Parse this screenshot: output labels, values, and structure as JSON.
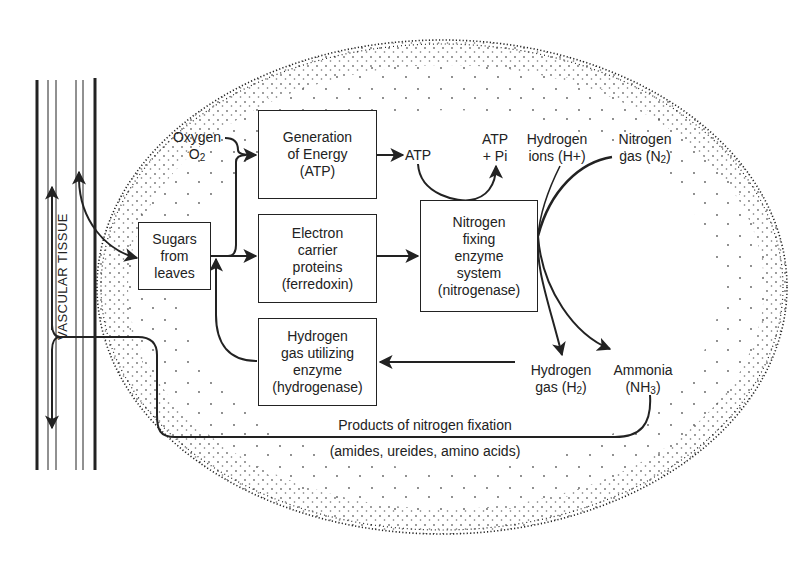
{
  "diagram": {
    "vascular_label": "VASCULAR TISSUE",
    "nodes": {
      "sugars": {
        "lines": [
          "Sugars",
          "from",
          "leaves"
        ]
      },
      "energy": {
        "lines": [
          "Generation",
          "of Energy",
          "(ATP)"
        ]
      },
      "electron": {
        "lines": [
          "Electron",
          "carrier",
          "proteins",
          "(ferredoxin)"
        ]
      },
      "hydrogenase": {
        "lines": [
          "Hydrogen",
          "gas utilizing",
          "enzyme",
          "(hydrogenase)"
        ]
      },
      "nitrogenase": {
        "lines": [
          "Nitrogen",
          "fixing",
          "enzyme",
          "system",
          "(nitrogenase)"
        ]
      }
    },
    "labels": {
      "oxygen": "Oxygen",
      "o2_base": "O",
      "o2_sub": "2",
      "atp": "ATP",
      "atp_pi_1": "ATP",
      "atp_pi_2": "+ Pi",
      "h_ions_1": "Hydrogen",
      "h_ions_2": "ions (H+)",
      "n2_1": "Nitrogen",
      "n2_2_base": "gas (N",
      "n2_2_sub": "2",
      "n2_2_end": ")",
      "h2_1": "Hydrogen",
      "h2_2_base": "gas (H",
      "h2_2_sub": "2",
      "h2_2_end": ")",
      "nh3_1": "Ammonia",
      "nh3_2_base": "(NH",
      "nh3_2_sub": "3",
      "nh3_2_end": ")",
      "products_1": "Products of nitrogen fixation",
      "products_2": "(amides, ureides, amino acids)"
    },
    "colors": {
      "ink": "#222222",
      "background": "#ffffff"
    }
  }
}
